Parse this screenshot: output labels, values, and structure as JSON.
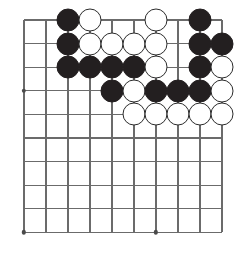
{
  "figure": {
    "kind": "go-board-diagram",
    "board": {
      "columns": 10,
      "rows": 10,
      "origin_x": 24,
      "origin_y": 20,
      "cell_w": 22,
      "cell_h": 23.6,
      "line_color": "#6b6b6b",
      "background_color": "#ffffff",
      "stone_radius": 11.5
    },
    "colors": {
      "black_stone": "#231f20",
      "white_stone": "#ffffff",
      "white_stone_border": "#2b2b2b",
      "star_point": "#4a4a4a",
      "grid": "#6b6b6b"
    },
    "star_points": [
      {
        "col": 1,
        "row": 4
      },
      {
        "col": 1,
        "row": 10
      },
      {
        "col": 7,
        "row": 10
      }
    ],
    "stones": [
      {
        "col": 3,
        "row": 1,
        "color": "black"
      },
      {
        "col": 4,
        "row": 1,
        "color": "white"
      },
      {
        "col": 7,
        "row": 1,
        "color": "white"
      },
      {
        "col": 9,
        "row": 1,
        "color": "black"
      },
      {
        "col": 3,
        "row": 2,
        "color": "black"
      },
      {
        "col": 4,
        "row": 2,
        "color": "white"
      },
      {
        "col": 5,
        "row": 2,
        "color": "white"
      },
      {
        "col": 6,
        "row": 2,
        "color": "white"
      },
      {
        "col": 7,
        "row": 2,
        "color": "white"
      },
      {
        "col": 9,
        "row": 2,
        "color": "black"
      },
      {
        "col": 10,
        "row": 2,
        "color": "black"
      },
      {
        "col": 3,
        "row": 3,
        "color": "black"
      },
      {
        "col": 4,
        "row": 3,
        "color": "black"
      },
      {
        "col": 5,
        "row": 3,
        "color": "black"
      },
      {
        "col": 6,
        "row": 3,
        "color": "black"
      },
      {
        "col": 7,
        "row": 3,
        "color": "white"
      },
      {
        "col": 9,
        "row": 3,
        "color": "black"
      },
      {
        "col": 10,
        "row": 3,
        "color": "white"
      },
      {
        "col": 5,
        "row": 4,
        "color": "black"
      },
      {
        "col": 6,
        "row": 4,
        "color": "white"
      },
      {
        "col": 7,
        "row": 4,
        "color": "black"
      },
      {
        "col": 8,
        "row": 4,
        "color": "black"
      },
      {
        "col": 9,
        "row": 4,
        "color": "black"
      },
      {
        "col": 10,
        "row": 4,
        "color": "white"
      },
      {
        "col": 6,
        "row": 5,
        "color": "white"
      },
      {
        "col": 7,
        "row": 5,
        "color": "white"
      },
      {
        "col": 8,
        "row": 5,
        "color": "white"
      },
      {
        "col": 9,
        "row": 5,
        "color": "white"
      },
      {
        "col": 10,
        "row": 5,
        "color": "white"
      }
    ]
  }
}
